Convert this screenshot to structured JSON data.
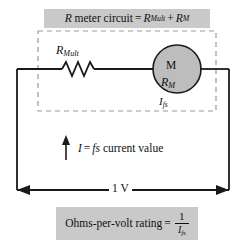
{
  "figure": {
    "title_banner": {
      "prefix_symbol": "R",
      "text": "meter circuit",
      "equals": "=",
      "term1_base": "R",
      "term1_sub": "Mult",
      "plus": "+",
      "term2_base": "R",
      "term2_sub": "M",
      "full_text": "R meter circuit = RMult + RM"
    },
    "bottom_banner": {
      "text": "Ohms-per-volt rating",
      "equals": "=",
      "numerator": "1",
      "denominator_base": "I",
      "denominator_sub": "fs",
      "full_text": "Ohms-per-volt rating = 1 / Ifs"
    },
    "resistor": {
      "label_base": "R",
      "label_sub": "Mult",
      "full_label": "RMult"
    },
    "meter": {
      "symbol": "M",
      "resistance_base": "R",
      "resistance_sub": "M",
      "current_base": "I",
      "current_sub": "fs",
      "fill_color": "#bdbdbd"
    },
    "current_note": {
      "symbol": "I",
      "equals": "=",
      "value": "fs",
      "text": "current value",
      "full_text": "I = fs current value"
    },
    "source": {
      "label": "1 V"
    },
    "colors": {
      "banner_background": "#c9c9c9",
      "wire": "#1a1a1a",
      "dashed_box": "#9a9a9a",
      "meter_fill": "#bdbdbd",
      "page_background": "#ffffff"
    }
  }
}
